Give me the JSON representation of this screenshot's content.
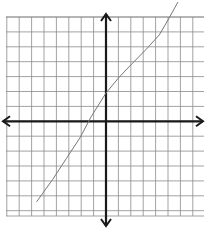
{
  "chart_data": {
    "type": "line",
    "title": "",
    "xlabel": "",
    "ylabel": "",
    "grid": true,
    "axes": {
      "x_arrows": true,
      "y_arrows": true
    },
    "grid_extent": {
      "x": [
        -8,
        8
      ],
      "y": [
        -6.5,
        7
      ]
    },
    "series": [
      {
        "name": "curve",
        "color": "#777777",
        "points": [
          [
            -5.6,
            -5.4
          ],
          [
            -4.3,
            -3.9
          ],
          [
            -3.2,
            -2.5
          ],
          [
            -2.1,
            -1.1
          ],
          [
            -1.2,
            0.3
          ],
          [
            0,
            1.9
          ],
          [
            1.0,
            2.9
          ],
          [
            1.9,
            3.7
          ],
          [
            3.2,
            4.8
          ],
          [
            4.3,
            5.8
          ],
          [
            5.0,
            6.8
          ],
          [
            5.8,
            8.0
          ]
        ]
      }
    ],
    "colors": {
      "grid": "#8a8a8a",
      "axis": "#1a1a1a",
      "curve": "#777777"
    }
  },
  "layout": {
    "origin_px": [
      106,
      121.3
    ],
    "unit_px": [
      12.4,
      14.9
    ],
    "grid_left": 6,
    "grid_right": 204,
    "grid_top": 17,
    "grid_bottom": 216
  }
}
